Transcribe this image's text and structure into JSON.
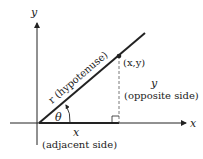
{
  "diagram": {
    "axes": {
      "x_label": "x",
      "y_label": "y"
    },
    "hypotenuse_label": "r (hypotenuse)",
    "point_label": "(x,y)",
    "angle_label": "θ",
    "opposite": {
      "var": "y",
      "desc": "(opposite side)"
    },
    "adjacent": {
      "var": "x",
      "desc": "(adjacent side)"
    },
    "colors": {
      "line": "#222222",
      "background": "#ffffff"
    }
  }
}
